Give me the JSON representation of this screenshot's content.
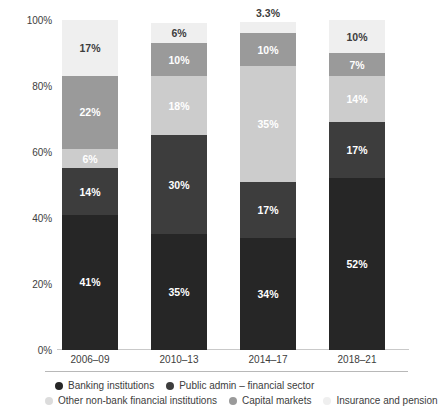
{
  "chart_data": {
    "type": "bar",
    "subtype": "stacked-100-percent",
    "title": "",
    "xlabel": "",
    "ylabel": "",
    "categories": [
      "2006–09",
      "2010–13",
      "2014–17",
      "2018–21"
    ],
    "ylim": [
      0,
      100
    ],
    "yticks": [
      "0%",
      "20%",
      "40%",
      "60%",
      "80%",
      "100%"
    ],
    "ytick_values": [
      0,
      20,
      40,
      60,
      80,
      100
    ],
    "grid": false,
    "legend_position": "bottom",
    "stack_order_bottom_to_top": [
      "Banking institutions",
      "Public admin – financial sector",
      "Other non-bank financial institutions",
      "Capital markets",
      "Insurance and pension"
    ],
    "series": [
      {
        "name": "Banking institutions",
        "color": "#262626",
        "values": [
          41,
          35,
          34,
          52
        ],
        "labels": [
          "41%",
          "35%",
          "34%",
          "52%"
        ],
        "label_color": "#ffffff"
      },
      {
        "name": "Public admin – financial sector",
        "color": "#3d3d3d",
        "values": [
          14,
          30,
          17,
          17
        ],
        "labels": [
          "14%",
          "30%",
          "17%",
          "17%"
        ],
        "label_color": "#ffffff"
      },
      {
        "name": "Other non-bank financial institutions",
        "color": "#cccccc",
        "values": [
          6,
          18,
          35,
          14
        ],
        "labels": [
          "6%",
          "18%",
          "35%",
          "14%"
        ],
        "label_color": "#ffffff"
      },
      {
        "name": "Capital markets",
        "color": "#9a9a9a",
        "values": [
          22,
          10,
          10,
          7
        ],
        "labels": [
          "22%",
          "10%",
          "10%",
          "7%"
        ],
        "label_color": "#ffffff"
      },
      {
        "name": "Insurance and pension",
        "color": "#efefef",
        "values": [
          17,
          6,
          3.3,
          10
        ],
        "labels": [
          "17%",
          "6%",
          "3.3%",
          "10%"
        ],
        "label_color": "#3d3d3d"
      }
    ]
  },
  "legend": {
    "rows": [
      [
        {
          "label": "Banking institutions",
          "color": "#262626"
        },
        {
          "label": "Public admin – financial sector",
          "color": "#3d3d3d"
        }
      ],
      [
        {
          "label": "Other non-bank financial institutions",
          "color": "#dcdcdc"
        },
        {
          "label": "Capital markets",
          "color": "#9a9a9a"
        },
        {
          "label": "Insurance and pension",
          "color": "#efefef"
        }
      ]
    ]
  }
}
